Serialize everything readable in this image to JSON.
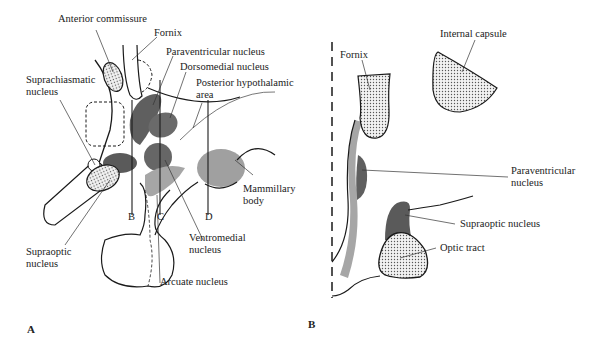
{
  "panel_a": {
    "letter": "A",
    "labels": {
      "anterior_commissure": "Anterior commissure",
      "fornix": "Fornix",
      "paraventricular": "Paraventricular nucleus",
      "dorsomedial": "Dorsomedial nucleus",
      "posterior_hypothalamic_1": "Posterior hypothalamic",
      "posterior_hypothalamic_2": "area",
      "suprachiasmatic_1": "Suprachiasmatic",
      "suprachiasmatic_2": "nucleus",
      "mammillary_1": "Mammillary",
      "mammillary_2": "body",
      "ventromedial_1": "Ventromedial",
      "ventromedial_2": "nucleus",
      "supraoptic_1": "Supraoptic",
      "supraoptic_2": "nucleus",
      "arcuate": "Arcuate nucleus",
      "section_b": "B",
      "section_c": "C",
      "section_d": "D"
    }
  },
  "panel_b": {
    "letter": "B",
    "labels": {
      "fornix": "Fornix",
      "internal_capsule": "Internal capsule",
      "paraventricular_1": "Paraventricular",
      "paraventricular_2": "nucleus",
      "supraoptic": "Supraoptic nucleus",
      "optic_tract": "Optic tract"
    }
  },
  "colors": {
    "dark_nucleus": "#5f5f5f",
    "medium_nucleus": "#7a7a7a",
    "light_nucleus": "#a8a8a8",
    "outline": "#1a1a1a"
  }
}
